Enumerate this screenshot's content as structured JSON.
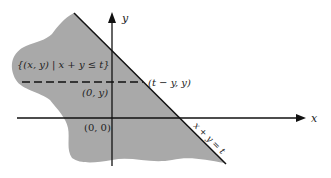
{
  "diagram": {
    "colors": {
      "region_fill": "#a9a9a9",
      "line": "#111111",
      "background": "#ffffff"
    },
    "axes": {
      "x_label": "x",
      "y_label": "y"
    },
    "labels": {
      "set": "{(x, y) | x + y ≤ t}",
      "point_on_line": "(t − y, y)",
      "point_on_axis": "(0, y)",
      "origin": "(0, 0)",
      "line_equation": "x + y = t"
    }
  }
}
